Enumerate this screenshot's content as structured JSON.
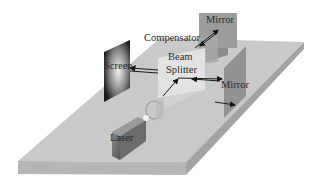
{
  "diagram": {
    "type": "michelson-interferometer",
    "labels": {
      "mirror_top": "Mirror",
      "compensator": "Compensator",
      "beam": "Beam",
      "splitter": "Splitter",
      "screen": "Screen",
      "mirror_right": "Mirror",
      "laser": "Laser"
    },
    "colors": {
      "table_top": "#c9c9c9",
      "table_side": "#a9a9a9",
      "table_front": "#b8b8b8",
      "mirror": "#9a9a9a",
      "splitter_glass": "#e4e4e4",
      "laser_body": "#6e6e6e",
      "beam_line": "#222222"
    }
  }
}
